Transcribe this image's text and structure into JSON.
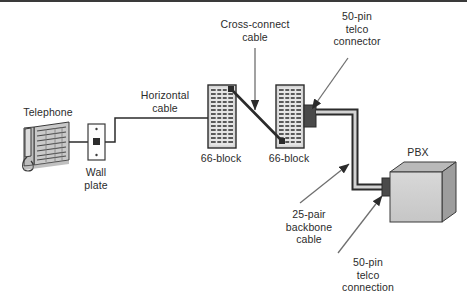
{
  "diagram": {
    "background_color": "#ffffff",
    "line_color": "#2b2b2b",
    "text_color": "#2b2b2b",
    "device_fill": "#cfcfcf",
    "device_shade": "#9a9a9a",
    "block_fill": "#d5d5d5"
  },
  "labels": {
    "telephone": "Telephone",
    "wall_plate": "Wall\nplate",
    "horizontal_cable": "Horizontal\ncable",
    "cross_connect_cable": "Cross-connect\ncable",
    "block_left": "66-block",
    "block_right": "66-block",
    "telco_connector": "50-pin\ntelco\nconnector",
    "backbone_cable": "25-pair\nbackbone\ncable",
    "telco_connection": "50-pin\ntelco\nconnection",
    "pbx": "PBX"
  },
  "nodes": [
    {
      "id": "telephone",
      "label": "Telephone",
      "x": 48,
      "y": 148
    },
    {
      "id": "wall-plate",
      "label": "Wall plate",
      "x": 95,
      "y": 137
    },
    {
      "id": "66-block-left",
      "label": "66-block",
      "x": 221,
      "y": 117
    },
    {
      "id": "66-block-right",
      "label": "66-block",
      "x": 289,
      "y": 117
    },
    {
      "id": "telco-connector",
      "label": "50-pin telco connector",
      "x": 316,
      "y": 119
    },
    {
      "id": "pbx",
      "label": "PBX",
      "x": 418,
      "y": 196
    },
    {
      "id": "telco-connection",
      "label": "50-pin telco connection",
      "x": 384,
      "y": 182
    }
  ],
  "links": [
    {
      "id": "phone-to-wallplate",
      "from": "telephone",
      "to": "wall-plate",
      "label": ""
    },
    {
      "id": "wallplate-to-block",
      "from": "wall-plate",
      "to": "66-block-left",
      "label": "Horizontal cable"
    },
    {
      "id": "block-to-block",
      "from": "66-block-left",
      "to": "66-block-right",
      "label": "Cross-connect cable"
    },
    {
      "id": "block-to-pbx",
      "from": "telco-connector",
      "to": "pbx",
      "label": "25-pair backbone cable"
    }
  ]
}
